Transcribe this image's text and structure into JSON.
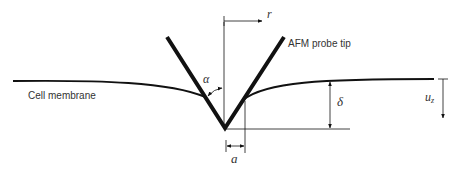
{
  "diagram": {
    "labels": {
      "membrane": "Cell membrane",
      "probe": "AFM probe tip",
      "radial_axis": "r",
      "half_angle": "α",
      "indentation_depth": "δ",
      "vertical_displacement": "u",
      "vertical_displacement_sub": "z",
      "contact_radius": "a"
    },
    "colors": {
      "stroke": "#111111",
      "text": "#333333",
      "background": "#ffffff"
    }
  }
}
